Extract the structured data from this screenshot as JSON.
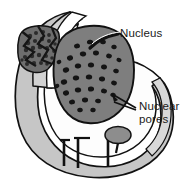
{
  "figure": {
    "kind": "biology-diagram",
    "background_color": "#ffffff",
    "ink_color": "#1a1a1a"
  },
  "labels": {
    "nucleus": "Nucleus",
    "nuclear_pores_line1": "Nuclear",
    "nuclear_pores_line2": "pores"
  },
  "palette": {
    "outline": "#111111",
    "envelope_gray": "#c6c6c6",
    "envelope_gray_dark": "#a9a9a9",
    "nucleus_gray": "#7e7e7e",
    "pore_dark": "#141414",
    "chromatin_dark": "#2b2b2b",
    "interior_white": "#fdfdfd",
    "blob_gray": "#8d8d8d"
  },
  "structures": {
    "nucleus_body": "nucleus",
    "nuclear_envelope": "nuclear-envelope",
    "chromatin_patch": "chromatin-patch",
    "pore_channels": "nuclear-pore-channels",
    "cytoplasm_blob": "cytoplasmic-blob"
  },
  "pores": [
    {
      "cx": 77,
      "cy": 46,
      "rx": 3.0,
      "ry": 2.4,
      "rot": -12
    },
    {
      "cx": 90,
      "cy": 42,
      "rx": 3.1,
      "ry": 2.3,
      "rot": -8
    },
    {
      "cx": 103,
      "cy": 42,
      "rx": 2.9,
      "ry": 2.3,
      "rot": 6
    },
    {
      "cx": 114,
      "cy": 47,
      "rx": 2.7,
      "ry": 2.2,
      "rot": 10
    },
    {
      "cx": 70,
      "cy": 58,
      "rx": 3.1,
      "ry": 2.5,
      "rot": -16
    },
    {
      "cx": 83,
      "cy": 54,
      "rx": 3.2,
      "ry": 2.4,
      "rot": -6
    },
    {
      "cx": 96,
      "cy": 53,
      "rx": 3.0,
      "ry": 2.4,
      "rot": 2
    },
    {
      "cx": 109,
      "cy": 56,
      "rx": 2.9,
      "ry": 2.3,
      "rot": 12
    },
    {
      "cx": 119,
      "cy": 60,
      "rx": 2.6,
      "ry": 2.1,
      "rot": 16
    },
    {
      "cx": 66,
      "cy": 70,
      "rx": 3.2,
      "ry": 2.5,
      "rot": -18
    },
    {
      "cx": 78,
      "cy": 66,
      "rx": 3.2,
      "ry": 2.5,
      "rot": -8
    },
    {
      "cx": 91,
      "cy": 65,
      "rx": 3.1,
      "ry": 2.5,
      "rot": 0
    },
    {
      "cx": 104,
      "cy": 67,
      "rx": 3.0,
      "ry": 2.4,
      "rot": 8
    },
    {
      "cx": 116,
      "cy": 71,
      "rx": 2.8,
      "ry": 2.2,
      "rot": 14
    },
    {
      "cx": 64,
      "cy": 82,
      "rx": 3.2,
      "ry": 2.6,
      "rot": -18
    },
    {
      "cx": 76,
      "cy": 78,
      "rx": 3.2,
      "ry": 2.5,
      "rot": -8
    },
    {
      "cx": 89,
      "cy": 77,
      "rx": 3.2,
      "ry": 2.5,
      "rot": 0
    },
    {
      "cx": 102,
      "cy": 79,
      "rx": 3.1,
      "ry": 2.4,
      "rot": 8
    },
    {
      "cx": 114,
      "cy": 83,
      "rx": 2.9,
      "ry": 2.3,
      "rot": 14
    },
    {
      "cx": 66,
      "cy": 93,
      "rx": 3.1,
      "ry": 2.5,
      "rot": -16
    },
    {
      "cx": 78,
      "cy": 90,
      "rx": 3.2,
      "ry": 2.5,
      "rot": -6
    },
    {
      "cx": 91,
      "cy": 89,
      "rx": 3.1,
      "ry": 2.5,
      "rot": 2
    },
    {
      "cx": 104,
      "cy": 91,
      "rx": 3.0,
      "ry": 2.4,
      "rot": 10
    },
    {
      "cx": 113,
      "cy": 95,
      "rx": 2.7,
      "ry": 2.2,
      "rot": 14
    },
    {
      "cx": 72,
      "cy": 102,
      "rx": 3.0,
      "ry": 2.4,
      "rot": -12
    },
    {
      "cx": 85,
      "cy": 100,
      "rx": 3.1,
      "ry": 2.4,
      "rot": -2
    },
    {
      "cx": 98,
      "cy": 101,
      "rx": 2.9,
      "ry": 2.3,
      "rot": 8
    },
    {
      "cx": 80,
      "cy": 110,
      "rx": 2.8,
      "ry": 2.2,
      "rot": -4
    },
    {
      "cx": 93,
      "cy": 110,
      "rx": 2.7,
      "ry": 2.2,
      "rot": 6
    },
    {
      "cx": 59,
      "cy": 62,
      "rx": 2.4,
      "ry": 2.0,
      "rot": -20
    },
    {
      "cx": 57,
      "cy": 86,
      "rx": 2.4,
      "ry": 2.0,
      "rot": -20
    }
  ],
  "chromatin_specks": [
    {
      "cx": 30,
      "cy": 36,
      "r": 2.2
    },
    {
      "cx": 36,
      "cy": 33,
      "r": 2.0
    },
    {
      "cx": 43,
      "cy": 32,
      "r": 2.1
    },
    {
      "cx": 49,
      "cy": 35,
      "r": 1.9
    },
    {
      "cx": 28,
      "cy": 43,
      "r": 2.3
    },
    {
      "cx": 35,
      "cy": 41,
      "r": 2.1
    },
    {
      "cx": 42,
      "cy": 39,
      "r": 2.2
    },
    {
      "cx": 49,
      "cy": 41,
      "r": 2.0
    },
    {
      "cx": 55,
      "cy": 44,
      "r": 1.8
    },
    {
      "cx": 26,
      "cy": 50,
      "r": 2.2
    },
    {
      "cx": 33,
      "cy": 48,
      "r": 2.2
    },
    {
      "cx": 40,
      "cy": 47,
      "r": 2.3
    },
    {
      "cx": 47,
      "cy": 48,
      "r": 2.1
    },
    {
      "cx": 54,
      "cy": 51,
      "r": 1.9
    },
    {
      "cx": 25,
      "cy": 57,
      "r": 2.1
    },
    {
      "cx": 32,
      "cy": 56,
      "r": 2.2
    },
    {
      "cx": 39,
      "cy": 55,
      "r": 2.2
    },
    {
      "cx": 46,
      "cy": 56,
      "r": 2.0
    },
    {
      "cx": 52,
      "cy": 58,
      "r": 1.8
    },
    {
      "cx": 27,
      "cy": 64,
      "r": 2.0
    },
    {
      "cx": 34,
      "cy": 63,
      "r": 2.1
    },
    {
      "cx": 41,
      "cy": 63,
      "r": 2.0
    },
    {
      "cx": 47,
      "cy": 64,
      "r": 1.8
    },
    {
      "cx": 22,
      "cy": 60,
      "r": 1.7
    },
    {
      "cx": 23,
      "cy": 68,
      "r": 1.6
    }
  ],
  "label_positions": {
    "nucleus": {
      "x": 120,
      "y": 37
    },
    "nuclear_pores_line1": {
      "x": 139,
      "y": 110
    },
    "nuclear_pores_line2": {
      "x": 139,
      "y": 123
    }
  }
}
